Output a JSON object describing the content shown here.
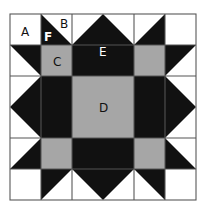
{
  "diagram": {
    "grid": {
      "cols": 6,
      "rows": 6,
      "origin_x": 10,
      "origin_y": 14,
      "cell": 31
    },
    "colors": {
      "background": "#ffffff",
      "dark": "#111111",
      "gray": "#a6a6a6",
      "line": "#555555"
    },
    "labels": {
      "A": "A",
      "B": "B",
      "C": "C",
      "D": "D",
      "E": "E",
      "F": "F"
    }
  }
}
